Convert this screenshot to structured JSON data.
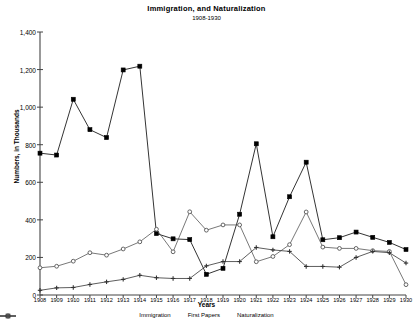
{
  "chart_data": {
    "type": "line",
    "title": "Immigration, and Naturalization",
    "subtitle": "1908-1930",
    "xlabel": "Years",
    "ylabel": "Numbers, in Thousands",
    "xlim": [
      1908,
      1930
    ],
    "ylim": [
      0,
      1400
    ],
    "yticks": [
      "0",
      "200",
      "400",
      "600",
      "800",
      "1,000",
      "1,200",
      "1,400"
    ],
    "ytick_values": [
      0,
      200,
      400,
      600,
      800,
      1000,
      1200,
      1400
    ],
    "grid": false,
    "legend_position": "bottom",
    "categories": [
      1908,
      1909,
      1910,
      1911,
      1912,
      1913,
      1914,
      1915,
      1916,
      1917,
      1918,
      1919,
      1920,
      1921,
      1922,
      1923,
      1924,
      1925,
      1926,
      1927,
      1928,
      1929,
      1930
    ],
    "xtick_labels": [
      "1908",
      "1909",
      "1910",
      "1911",
      "1912",
      "1913",
      "1914",
      "1915",
      "1916",
      "1917",
      "1918",
      "1919",
      "1920",
      "1921",
      "1922",
      "1923",
      "1924",
      "1925",
      "1926",
      "1927",
      "1928",
      "1929",
      "1930"
    ],
    "series": [
      {
        "name": "Immigration",
        "marker": "filled-square",
        "color": "#000000",
        "values": [
          755,
          745,
          1042,
          880,
          838,
          1198,
          1218,
          327,
          299,
          295,
          110,
          142,
          430,
          805,
          310,
          523,
          707,
          294,
          305,
          335,
          307,
          280,
          242
        ]
      },
      {
        "name": "First Papers",
        "marker": "open-circle",
        "color": "#555555",
        "values": [
          145,
          153,
          180,
          225,
          212,
          245,
          283,
          350,
          230,
          443,
          345,
          373,
          373,
          177,
          205,
          268,
          442,
          255,
          248,
          248,
          236,
          232,
          55
        ]
      },
      {
        "name": "Naturalization",
        "marker": "plus",
        "color": "#333333",
        "values": [
          25,
          38,
          40,
          56,
          70,
          83,
          105,
          92,
          88,
          88,
          155,
          178,
          178,
          253,
          240,
          232,
          152,
          152,
          148,
          200,
          232,
          225,
          170
        ]
      }
    ]
  }
}
